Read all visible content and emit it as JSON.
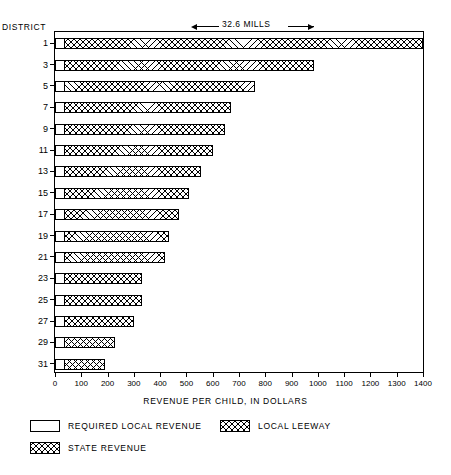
{
  "labels": {
    "district_axis": "DISTRICT",
    "mills_annotation": "32.6 MILLS",
    "x_axis_title": "REVENUE PER CHILD, IN DOLLARS"
  },
  "legend": [
    {
      "key": "required_local_revenue",
      "label": "REQUIRED LOCAL REVENUE",
      "pattern": "solid-white"
    },
    {
      "key": "local_leeway",
      "label": "LOCAL LEEWAY",
      "pattern": "cross-hatch"
    },
    {
      "key": "state_revenue",
      "label": "STATE REVENUE",
      "pattern": "cross-hatch"
    }
  ],
  "chart_data": {
    "type": "bar",
    "orientation": "horizontal",
    "title": "",
    "subtitle": "",
    "xlabel": "REVENUE PER CHILD, IN DOLLARS",
    "ylabel": "DISTRICT",
    "xlim": [
      0,
      1400
    ],
    "xticks": [
      0,
      100,
      200,
      300,
      400,
      500,
      600,
      700,
      800,
      900,
      1000,
      1100,
      1200,
      1300,
      1400
    ],
    "xtick_labels": [
      "0",
      "100",
      "200",
      "300",
      "400",
      "500",
      "600",
      "700",
      "800",
      "900",
      "1000",
      "1100",
      "1200",
      "1300",
      "1400"
    ],
    "grid": false,
    "legend_position": "below",
    "categories": [
      "1",
      "3",
      "5",
      "7",
      "9",
      "11",
      "13",
      "15",
      "17",
      "19",
      "21",
      "23",
      "25",
      "27",
      "29",
      "31"
    ],
    "ytick_labels": [
      "1",
      "3",
      "5",
      "7",
      "9",
      "11",
      "13",
      "15",
      "17",
      "19",
      "21",
      "23",
      "25",
      "27",
      "29",
      "31"
    ],
    "annotations": [
      {
        "text": "32.6 MILLS",
        "x": 700,
        "y": "above-plot"
      }
    ],
    "series": [
      {
        "name": "REQUIRED LOCAL REVENUE",
        "values": [
          30,
          30,
          30,
          30,
          30,
          30,
          30,
          30,
          30,
          30,
          30,
          30,
          30,
          30,
          30,
          30
        ]
      },
      {
        "name": "LOCAL LEEWAY",
        "values": [
          1370,
          955,
          730,
          640,
          615,
          570,
          525,
          480,
          440,
          405,
          390,
          300,
          300,
          270,
          200,
          160
        ]
      }
    ],
    "totals": [
      1400,
      985,
      760,
      670,
      645,
      600,
      555,
      510,
      470,
      435,
      420,
      330,
      330,
      300,
      230,
      190
    ]
  }
}
